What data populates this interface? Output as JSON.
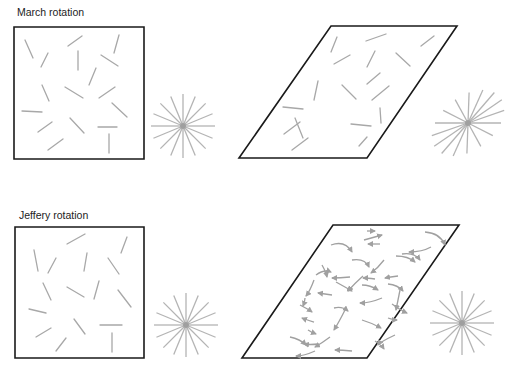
{
  "panels": {
    "march": {
      "title": "March rotation",
      "title_pos": [
        17,
        6
      ]
    },
    "jeffery": {
      "title": "Jeffery rotation",
      "title_pos": [
        19,
        209
      ]
    }
  },
  "colors": {
    "frame": "#1a1a1a",
    "fiber": "#a8a8a8",
    "arrow": "#a0a0a0",
    "star": "#b4b4b4",
    "star_center": "#9a9a9a"
  },
  "shapes": {
    "square_march": [
      [
        14,
        27
      ],
      [
        144,
        27
      ],
      [
        144,
        159
      ],
      [
        14,
        159
      ]
    ],
    "para_march": [
      [
        331,
        26
      ],
      [
        457,
        26
      ],
      [
        367,
        158
      ],
      [
        239,
        158
      ]
    ],
    "square_jeffery": [
      [
        15,
        227
      ],
      [
        144,
        227
      ],
      [
        144,
        358
      ],
      [
        15,
        358
      ]
    ],
    "para_jeffery": [
      [
        333,
        225
      ],
      [
        459,
        225
      ],
      [
        367,
        358
      ],
      [
        242,
        358
      ]
    ]
  },
  "stars": [
    {
      "name": "star-march-square",
      "cx": 183,
      "cy": 126,
      "r": 32,
      "rays": 16
    },
    {
      "name": "star-march-sheared",
      "cx": 468,
      "cy": 123,
      "r": 33,
      "rays": 16,
      "shear": 0.45
    },
    {
      "name": "star-jeffery-square",
      "cx": 186,
      "cy": 325,
      "r": 32,
      "rays": 16
    },
    {
      "name": "star-jeffery-sheared",
      "cx": 462,
      "cy": 323,
      "r": 32,
      "rays": 16
    }
  ],
  "fibers_march_square": [
    [
      25,
      40,
      33,
      58
    ],
    [
      48,
      53,
      41,
      67
    ],
    [
      68,
      46,
      82,
      36
    ],
    [
      78,
      51,
      78,
      70
    ],
    [
      119,
      35,
      114,
      53
    ],
    [
      101,
      55,
      118,
      66
    ],
    [
      96,
      68,
      89,
      85
    ],
    [
      42,
      85,
      49,
      101
    ],
    [
      65,
      87,
      83,
      98
    ],
    [
      99,
      98,
      115,
      87
    ],
    [
      112,
      103,
      127,
      117
    ],
    [
      22,
      111,
      42,
      112
    ],
    [
      38,
      132,
      52,
      122
    ],
    [
      70,
      118,
      84,
      133
    ],
    [
      98,
      127,
      117,
      127
    ],
    [
      48,
      150,
      63,
      139
    ],
    [
      109,
      134,
      109,
      153
    ]
  ],
  "fibers_march_para": [
    [
      337,
      37,
      331,
      52
    ],
    [
      366,
      41,
      386,
      34
    ],
    [
      334,
      64,
      350,
      55
    ],
    [
      375,
      51,
      367,
      67
    ],
    [
      396,
      53,
      410,
      66
    ],
    [
      421,
      46,
      434,
      36
    ],
    [
      380,
      73,
      367,
      84
    ],
    [
      318,
      81,
      314,
      100
    ],
    [
      342,
      85,
      356,
      99
    ],
    [
      372,
      100,
      389,
      86
    ],
    [
      283,
      107,
      303,
      109
    ],
    [
      380,
      108,
      381,
      123
    ],
    [
      284,
      134,
      300,
      122
    ],
    [
      295,
      118,
      303,
      138
    ],
    [
      351,
      124,
      371,
      126
    ],
    [
      292,
      150,
      308,
      138
    ],
    [
      359,
      146,
      367,
      137
    ]
  ],
  "fibers_jeffery_square": [
    [
      34,
      250,
      38,
      271
    ],
    [
      67,
      244,
      85,
      234
    ],
    [
      127,
      237,
      121,
      253
    ],
    [
      56,
      258,
      48,
      273
    ],
    [
      87,
      253,
      84,
      271
    ],
    [
      108,
      258,
      119,
      274
    ],
    [
      43,
      283,
      51,
      300
    ],
    [
      67,
      287,
      84,
      297
    ],
    [
      99,
      281,
      94,
      299
    ],
    [
      118,
      290,
      131,
      307
    ],
    [
      29,
      309,
      46,
      313
    ],
    [
      36,
      337,
      51,
      328
    ],
    [
      74,
      319,
      85,
      334
    ],
    [
      100,
      325,
      122,
      325
    ],
    [
      56,
      351,
      66,
      338
    ],
    [
      112,
      333,
      112,
      352
    ]
  ],
  "arrows_jeffery": [
    [
      [
        367,
        231
      ],
      [
        375,
        231
      ],
      [
        375,
        231
      ]
    ],
    [
      [
        364,
        240
      ],
      [
        382,
        235
      ],
      [
        382,
        235
      ]
    ],
    [
      [
        380,
        244
      ],
      [
        368,
        244
      ],
      [
        368,
        244
      ]
    ],
    [
      [
        331,
        245
      ],
      [
        345,
        240
      ],
      [
        352,
        252
      ]
    ],
    [
      [
        425,
        232
      ],
      [
        440,
        233
      ],
      [
        445,
        245
      ]
    ],
    [
      [
        431,
        247
      ],
      [
        422,
        252
      ],
      [
        409,
        252
      ]
    ],
    [
      [
        352,
        260
      ],
      [
        365,
        258
      ],
      [
        369,
        267
      ]
    ],
    [
      [
        396,
        256
      ],
      [
        408,
        256
      ],
      [
        415,
        262
      ]
    ],
    [
      [
        402,
        254
      ],
      [
        414,
        252
      ],
      [
        420,
        260
      ]
    ],
    [
      [
        384,
        260
      ],
      [
        378,
        268
      ],
      [
        371,
        273
      ]
    ],
    [
      [
        322,
        265
      ],
      [
        326,
        272
      ],
      [
        327,
        277
      ]
    ],
    [
      [
        316,
        275
      ],
      [
        324,
        269
      ],
      [
        331,
        272
      ]
    ],
    [
      [
        350,
        277
      ],
      [
        340,
        278
      ],
      [
        332,
        278
      ]
    ],
    [
      [
        363,
        276
      ],
      [
        354,
        284
      ],
      [
        348,
        291
      ]
    ],
    [
      [
        375,
        279
      ],
      [
        367,
        278
      ],
      [
        363,
        278
      ]
    ],
    [
      [
        398,
        276
      ],
      [
        390,
        277
      ],
      [
        385,
        278
      ]
    ],
    [
      [
        336,
        282
      ],
      [
        345,
        287
      ],
      [
        352,
        291
      ]
    ],
    [
      [
        362,
        285
      ],
      [
        370,
        285
      ],
      [
        378,
        290
      ]
    ],
    [
      [
        388,
        284
      ],
      [
        398,
        285
      ],
      [
        403,
        291
      ]
    ],
    [
      [
        314,
        280
      ],
      [
        310,
        291
      ],
      [
        306,
        296
      ]
    ],
    [
      [
        332,
        295
      ],
      [
        325,
        294
      ],
      [
        318,
        293
      ]
    ],
    [
      [
        400,
        290
      ],
      [
        397,
        305
      ],
      [
        396,
        310
      ]
    ],
    [
      [
        382,
        298
      ],
      [
        370,
        303
      ],
      [
        360,
        303
      ]
    ],
    [
      [
        305,
        298
      ],
      [
        305,
        301
      ],
      [
        303,
        306
      ]
    ],
    [
      [
        300,
        305
      ],
      [
        308,
        309
      ],
      [
        312,
        312
      ]
    ],
    [
      [
        334,
        308
      ],
      [
        342,
        306
      ],
      [
        348,
        311
      ]
    ],
    [
      [
        314,
        322
      ],
      [
        307,
        320
      ],
      [
        302,
        318
      ]
    ],
    [
      [
        345,
        310
      ],
      [
        339,
        322
      ],
      [
        334,
        330
      ]
    ],
    [
      [
        392,
        304
      ],
      [
        400,
        310
      ],
      [
        407,
        313
      ]
    ],
    [
      [
        388,
        318
      ],
      [
        394,
        320
      ],
      [
        397,
        320
      ]
    ],
    [
      [
        308,
        330
      ],
      [
        311,
        332
      ],
      [
        316,
        334
      ]
    ],
    [
      [
        362,
        320
      ],
      [
        372,
        323
      ],
      [
        381,
        328
      ]
    ],
    [
      [
        290,
        337
      ],
      [
        300,
        339
      ],
      [
        306,
        345
      ]
    ],
    [
      [
        318,
        344
      ],
      [
        310,
        345
      ],
      [
        304,
        344
      ]
    ],
    [
      [
        330,
        337
      ],
      [
        322,
        343
      ],
      [
        315,
        347
      ]
    ],
    [
      [
        395,
        335
      ],
      [
        380,
        342
      ],
      [
        378,
        345
      ]
    ],
    [
      [
        375,
        341
      ],
      [
        382,
        346
      ],
      [
        384,
        349
      ]
    ],
    [
      [
        315,
        351
      ],
      [
        304,
        356
      ],
      [
        296,
        356
      ]
    ],
    [
      [
        352,
        351
      ],
      [
        342,
        350
      ],
      [
        335,
        350
      ]
    ]
  ]
}
